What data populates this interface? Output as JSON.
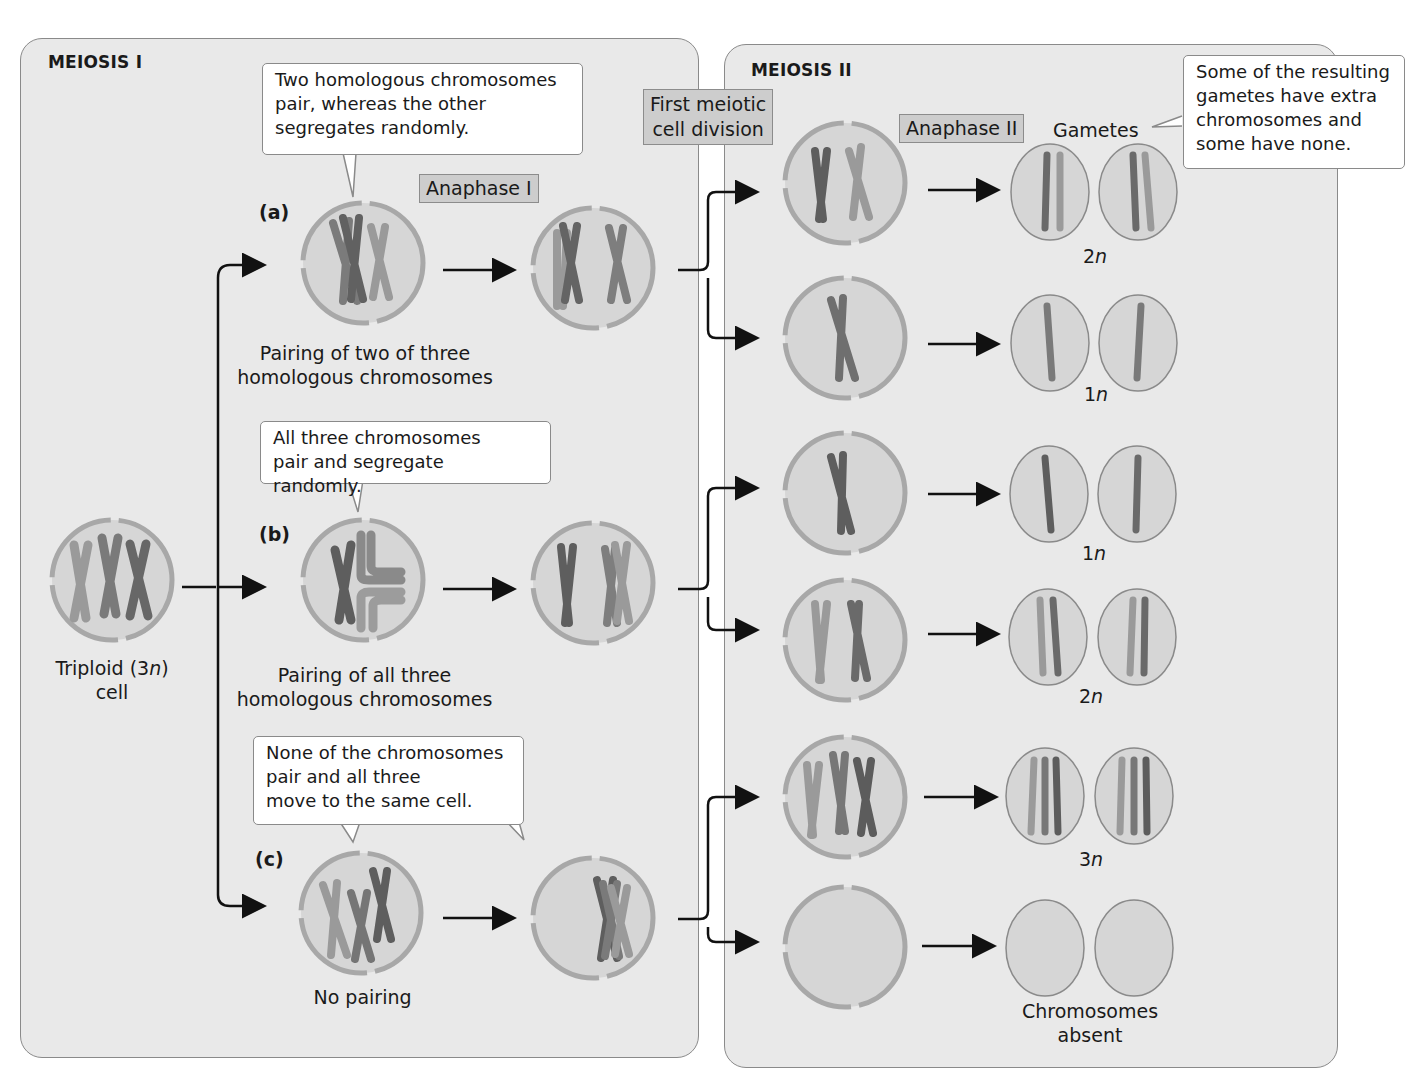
{
  "meiosis1": {
    "title": "MEIOSIS I",
    "anaphase_tag": "Anaphase I",
    "division_tag": "First meiotic\ncell division",
    "start_cell_label_pre": "Triploid (3",
    "start_cell_label_n": "n",
    "start_cell_label_post": ")",
    "start_cell_label_line2": "cell",
    "cases": [
      {
        "letter": "(a)",
        "callout": "Two homologous chromosomes\npair, whereas the other\nsegregates randomly.",
        "label_line1": "Pairing of two of three",
        "label_line2": "homologous chromosomes"
      },
      {
        "letter": "(b)",
        "callout": "All three chromosomes\npair and segregate randomly.",
        "label_line1": "Pairing of all three",
        "label_line2": "homologous chromosomes"
      },
      {
        "letter": "(c)",
        "callout": "None of the chromosomes\npair and all three\nmove to the same cell.",
        "label_line1": "No pairing",
        "label_line2": ""
      }
    ]
  },
  "meiosis2": {
    "title": "MEIOSIS II",
    "anaphase_tag": "Anaphase II",
    "gametes_label": "Gametes",
    "callout": "Some of the resulting\ngametes have extra\nchromosomes and\nsome have none.",
    "ploidy": [
      {
        "num": "2",
        "n": "n"
      },
      {
        "num": "1",
        "n": "n"
      },
      {
        "num": "1",
        "n": "n"
      },
      {
        "num": "2",
        "n": "n"
      },
      {
        "num": "3",
        "n": "n"
      }
    ],
    "absent_line1": "Chromosomes",
    "absent_line2": "absent"
  },
  "colors": {
    "panel_bg": "#e9e9e9",
    "cell_fill": "#d6d6d6",
    "cell_membrane": "#a8a8a8",
    "chrom_dark": "#6a6a6a",
    "chrom_mid": "#858585",
    "chrom_light": "#9d9d9d",
    "tag_bg": "#cdcdcd"
  }
}
